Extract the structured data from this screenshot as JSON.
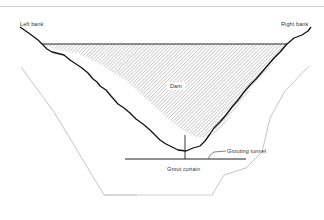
{
  "diagram": {
    "type": "dam cross-section",
    "labels": {
      "left_bank": "Left bank",
      "right_bank": "Right bank",
      "dam": "Dam",
      "grouting_tunnel": "Grouting tunnel",
      "grout_curtain": "Grout curtain"
    },
    "colors": {
      "outline": "#111111",
      "hatch": "#9a9a9a",
      "excavation_line": "#b5b5b5",
      "background": "#ffffff"
    }
  }
}
